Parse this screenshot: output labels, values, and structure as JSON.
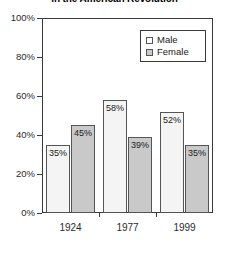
{
  "chart_data": {
    "type": "bar",
    "title": "in the American Revolution",
    "xlabel": "",
    "ylabel": "",
    "categories": [
      "1924",
      "1977",
      "1999"
    ],
    "series": [
      {
        "name": "Male",
        "values": [
          35,
          58,
          52
        ],
        "color": "#f4f4f4"
      },
      {
        "name": "Female",
        "values": [
          45,
          39,
          35
        ],
        "color": "#c9c9c9"
      }
    ],
    "ylim": [
      0,
      100
    ],
    "y_ticks": [
      0,
      20,
      40,
      60,
      80,
      100
    ],
    "y_tick_labels": [
      "0%",
      "20%",
      "40%",
      "60%",
      "80%",
      "100%"
    ],
    "data_labels": [
      "35%",
      "45%",
      "58%",
      "39%",
      "52%",
      "35%"
    ],
    "grid": false,
    "legend_position": "top-right"
  },
  "legend": {
    "items": [
      {
        "label": "Male"
      },
      {
        "label": "Female"
      }
    ]
  },
  "axes": {
    "y_tick_labels": [
      "100%",
      "80%",
      "60%",
      "40%",
      "20%",
      "0%"
    ],
    "x_tick_labels": [
      "1924",
      "1977",
      "1999"
    ]
  }
}
